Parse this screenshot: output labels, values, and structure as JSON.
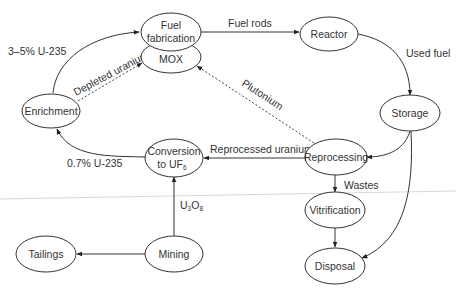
{
  "diagram": {
    "nodes": [
      {
        "id": "fuel_fabrication",
        "line1": "Fuel",
        "line2": "fabrication"
      },
      {
        "id": "mox",
        "label": "MOX"
      },
      {
        "id": "reactor",
        "label": "Reactor"
      },
      {
        "id": "storage",
        "label": "Storage"
      },
      {
        "id": "reprocessing",
        "label": "Reprocessing"
      },
      {
        "id": "enrichment",
        "label": "Enrichment"
      },
      {
        "id": "conversion",
        "line1": "Conversion",
        "line2_main": "to UF",
        "line2_sub": "6"
      },
      {
        "id": "vitrification",
        "label": "Vitrification"
      },
      {
        "id": "tailings",
        "label": "Tailings"
      },
      {
        "id": "mining",
        "label": "Mining"
      },
      {
        "id": "disposal",
        "label": "Disposal"
      }
    ],
    "edges": [
      {
        "from": "enrichment",
        "to": "fuel_fabrication",
        "label": "3–5% U-235",
        "style": "solid"
      },
      {
        "from": "enrichment",
        "to": "mox",
        "label": "Depleted uranium",
        "style": "dashed"
      },
      {
        "from": "fuel_fabrication",
        "to": "reactor",
        "label": "Fuel rods",
        "style": "solid"
      },
      {
        "from": "reactor",
        "to": "storage",
        "label": "Used fuel",
        "style": "solid"
      },
      {
        "from": "storage",
        "to": "reprocessing",
        "label": "",
        "style": "solid"
      },
      {
        "from": "storage",
        "to": "disposal",
        "label": "",
        "style": "solid"
      },
      {
        "from": "reprocessing",
        "to": "mox",
        "label": "Plutonium",
        "style": "dashed"
      },
      {
        "from": "reprocessing",
        "to": "conversion",
        "label": "Reprocessed uranium",
        "style": "solid"
      },
      {
        "from": "conversion",
        "to": "enrichment",
        "label": "0.7% U-235",
        "style": "solid"
      },
      {
        "from": "mining",
        "to": "conversion",
        "label_main": "U",
        "label_sub1": "3",
        "label_mid": "O",
        "label_sub2": "8",
        "style": "solid"
      },
      {
        "from": "mining",
        "to": "tailings",
        "label": "",
        "style": "solid"
      },
      {
        "from": "reprocessing",
        "to": "vitrification",
        "label": "Wastes",
        "style": "solid"
      },
      {
        "from": "vitrification",
        "to": "disposal",
        "label": "",
        "style": "solid"
      }
    ]
  },
  "colors": {
    "stroke": "#333333",
    "text": "#333333",
    "background": "#ffffff"
  }
}
